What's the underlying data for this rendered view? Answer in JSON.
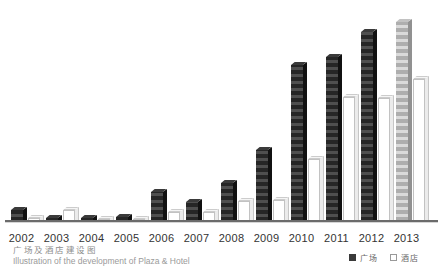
{
  "chart": {
    "caption_zh": "广场及酒店建设图",
    "caption_en": "Illustration of the development of Plaza & Hotel",
    "legend": {
      "plaza_label": "广场",
      "hotel_label": "酒店"
    },
    "colors": {
      "plaza_bar": "#262626",
      "plaza_bar_projected": "#aeaeae",
      "hotel_bar": "#ffffff",
      "hotel_bar_border": "#c2c2c2",
      "axis": "#6b6b6b",
      "label_text": "#333333",
      "caption_text": "#9a9a9a"
    }
  },
  "chart_data": {
    "type": "bar",
    "title": "广场及酒店建设图",
    "subtitle": "Illustration of the development of Plaza & Hotel",
    "categories": [
      "2002",
      "2003",
      "2004",
      "2005",
      "2006",
      "2007",
      "2008",
      "2009",
      "2010",
      "2011",
      "2012",
      "2013"
    ],
    "series": [
      {
        "name": "广场",
        "style": "dark-striped-3d",
        "values": [
          11,
          3,
          3,
          4,
          29,
          19,
          38,
          71,
          156,
          164,
          189,
          199
        ],
        "projected_index": 11,
        "projected_note": "2013 plaza bar drawn in light gray (projected/under construction)"
      },
      {
        "name": "酒店",
        "style": "white-outline-3d",
        "values": [
          3,
          11,
          2,
          2,
          9,
          9,
          20,
          21,
          62,
          124,
          123,
          142
        ]
      }
    ],
    "value_unit": "relative height (no y-axis / scale shown in image)",
    "xlabel": "",
    "ylabel": "",
    "grid": false,
    "legend_position": "bottom-right",
    "caption_position": "bottom-left"
  }
}
